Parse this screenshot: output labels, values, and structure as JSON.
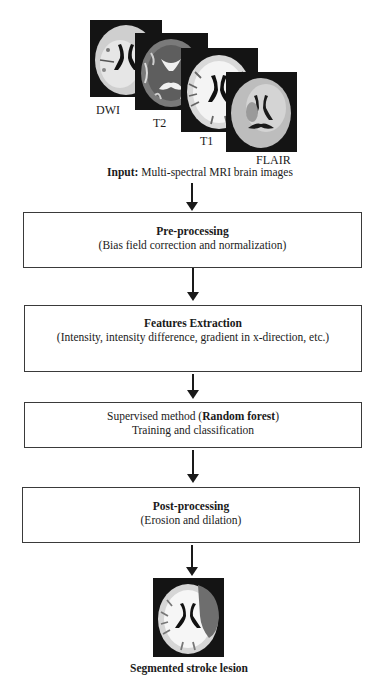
{
  "input": {
    "images": [
      {
        "label": "DWI",
        "icon": "brain-mri-dwi"
      },
      {
        "label": "T2",
        "icon": "brain-mri-t2"
      },
      {
        "label": "T1",
        "icon": "brain-mri-t1"
      },
      {
        "label": "FLAIR",
        "icon": "brain-mri-flair"
      }
    ],
    "caption_bold": "Input:",
    "caption_rest": " Multi-spectral MRI brain images"
  },
  "steps": [
    {
      "title": "Pre-processing",
      "subtitle": "(Bias field correction and normalization)"
    },
    {
      "title": "Features Extraction",
      "subtitle": "(Intensity, intensity difference, gradient in x-direction, etc.)"
    },
    {
      "prefix": "Supervised method (",
      "title": "Random forest",
      "suffix": ")",
      "subtitle": "Training and classification"
    },
    {
      "title": "Post-processing",
      "subtitle": "(Erosion and dilation)"
    }
  ],
  "output": {
    "icon": "segmented-brain-lesion",
    "caption": "Segmented stroke lesion",
    "lesion_color": "#6e6e6e"
  }
}
